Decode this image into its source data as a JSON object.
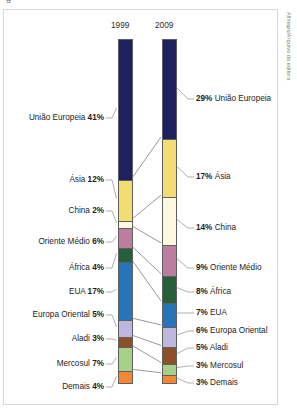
{
  "credit": "Allmaps/Arquivo da editora",
  "top_cut_text": "g",
  "years": {
    "left": "1999",
    "right": "2009"
  },
  "chart_data": {
    "type": "bar",
    "title": "",
    "subtitle": "",
    "xlabel": "",
    "ylabel": "",
    "categories": [
      "1999",
      "2009"
    ],
    "grid": false,
    "legend_position": "none",
    "stacked": true,
    "ylim": [
      0,
      100
    ],
    "series": [
      {
        "name": "União Europeia",
        "values": [
          41,
          29
        ],
        "color": "#1e2060"
      },
      {
        "name": "Ásia",
        "values": [
          12,
          17
        ],
        "color": "#f2dd72"
      },
      {
        "name": "China",
        "values": [
          2,
          14
        ],
        "color": "#fdf8e0"
      },
      {
        "name": "Oriente Médio",
        "values": [
          6,
          9
        ],
        "color": "#bb7ea1"
      },
      {
        "name": "África",
        "values": [
          4,
          8
        ],
        "color": "#24603a"
      },
      {
        "name": "EUA",
        "values": [
          17,
          7
        ],
        "color": "#2774bb"
      },
      {
        "name": "Europa Oriental",
        "values": [
          5,
          6
        ],
        "color": "#bdb6dd"
      },
      {
        "name": "Aladi",
        "values": [
          3,
          5
        ],
        "color": "#8c4f29"
      },
      {
        "name": "Mercosul",
        "values": [
          7,
          3
        ],
        "color": "#a7d08a"
      },
      {
        "name": "Demais",
        "values": [
          4,
          3
        ],
        "color": "#f58733"
      }
    ],
    "left_labels": [
      {
        "text": "União Europeia 41%",
        "name": "União Europeia",
        "value": "41%"
      },
      {
        "text": "Ásia 12%",
        "name": "Ásia",
        "value": "12%"
      },
      {
        "text": "China 2%",
        "name": "China",
        "value": "2%"
      },
      {
        "text": "Oriente Médio 6%",
        "name": "Oriente Médio",
        "value": "6%"
      },
      {
        "text": "África 4%",
        "name": "África",
        "value": "4%"
      },
      {
        "text": "EUA 17%",
        "name": "EUA",
        "value": "17%"
      },
      {
        "text": "Europa Oriental 5%",
        "name": "Europa Oriental",
        "value": "5%"
      },
      {
        "text": "Aladi 3%",
        "name": "Aladi",
        "value": "3%"
      },
      {
        "text": "Mercosul 7%",
        "name": "Mercosul",
        "value": "7%"
      },
      {
        "text": "Demais 4%",
        "name": "Demais",
        "value": "4%"
      }
    ],
    "right_labels": [
      {
        "text": "29% União Europeia",
        "value": "29%",
        "name": "União Europeia"
      },
      {
        "text": "17% Ásia",
        "value": "17%",
        "name": "Ásia"
      },
      {
        "text": "14% China",
        "value": "14%",
        "name": "China"
      },
      {
        "text": "9% Oriente Médio",
        "value": "9%",
        "name": "Oriente Médio"
      },
      {
        "text": "8% África",
        "value": "8%",
        "name": "África"
      },
      {
        "text": "7% EUA",
        "value": "7%",
        "name": "EUA"
      },
      {
        "text": "6% Europa Oriental",
        "value": "6%",
        "name": "Europa Oriental"
      },
      {
        "text": "5% Aladi",
        "value": "5%",
        "name": "Aladi"
      },
      {
        "text": "3% Mercosul",
        "value": "3%",
        "name": "Mercosul"
      },
      {
        "text": "3% Demais",
        "value": "3%",
        "name": "Demais"
      }
    ]
  },
  "labels_left": {
    "l0_name": "União Europeia",
    "l0_val": "41%",
    "l1_name": "Ásia",
    "l1_val": "12%",
    "l2_name": "China",
    "l2_val": "2%",
    "l3_name": "Oriente Médio",
    "l3_val": "6%",
    "l4_name": "África",
    "l4_val": "4%",
    "l5_name": "EUA",
    "l5_val": "17%",
    "l6_name": "Europa Oriental",
    "l6_val": "5%",
    "l7_name": "Aladi",
    "l7_val": "3%",
    "l8_name": "Mercosul",
    "l8_val": "7%",
    "l9_name": "Demais",
    "l9_val": "4%"
  },
  "labels_right": {
    "r0_val": "29%",
    "r0_name": "União Europeia",
    "r1_val": "17%",
    "r1_name": "Ásia",
    "r2_val": "14%",
    "r2_name": "China",
    "r3_val": "9%",
    "r3_name": "Oriente Médio",
    "r4_val": "8%",
    "r4_name": "África",
    "r5_val": "7%",
    "r5_name": "EUA",
    "r6_val": "6%",
    "r6_name": "Europa Oriental",
    "r7_val": "5%",
    "r7_name": "Aladi",
    "r8_val": "3%",
    "r8_name": "Mercosul",
    "r9_val": "3%",
    "r9_name": "Demais"
  }
}
